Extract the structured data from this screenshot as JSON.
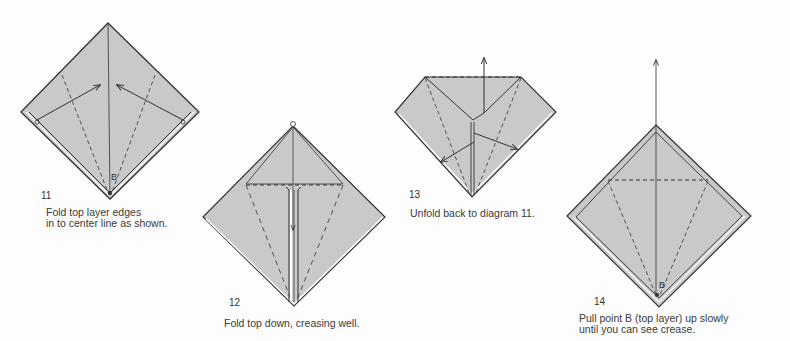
{
  "colors": {
    "paper_fill": "#c9c9c9",
    "line": "#333333",
    "background": "#fdfdfd"
  },
  "steps": [
    {
      "number": "11",
      "label_point": "B",
      "caption_lines": [
        "Fold top layer edges",
        "in to center line as shown."
      ]
    },
    {
      "number": "12",
      "caption_lines": [
        "Fold top down, creasing well."
      ]
    },
    {
      "number": "13",
      "caption_lines": [
        "Unfold back to diagram 11."
      ]
    },
    {
      "number": "14",
      "label_point": "B",
      "caption_lines": [
        "Pull point B (top layer) up slowly",
        "until you can see crease."
      ]
    }
  ]
}
